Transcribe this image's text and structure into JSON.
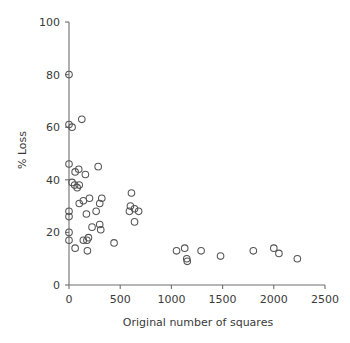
{
  "chart_data": {
    "type": "scatter",
    "title": "",
    "xlabel": "Original number of squares",
    "ylabel": "% Loss",
    "xlim": [
      0,
      2500
    ],
    "ylim": [
      0,
      100
    ],
    "xticks": [
      0,
      500,
      1000,
      1500,
      2000,
      2500
    ],
    "yticks": [
      0,
      20,
      40,
      60,
      80,
      100
    ],
    "xtick_labels": [
      "0",
      "500",
      "1000",
      "1500",
      "2000",
      "2500"
    ],
    "ytick_labels": [
      "0",
      "20",
      "40",
      "60",
      "80",
      "100"
    ],
    "grid": false,
    "legend": null,
    "marker": "open-circle",
    "marker_color": "#555555",
    "points": [
      {
        "x": 0,
        "y": 80
      },
      {
        "x": 0,
        "y": 61
      },
      {
        "x": 30,
        "y": 60
      },
      {
        "x": 125,
        "y": 63
      },
      {
        "x": 0,
        "y": 46
      },
      {
        "x": 60,
        "y": 43
      },
      {
        "x": 95,
        "y": 44
      },
      {
        "x": 160,
        "y": 42
      },
      {
        "x": 285,
        "y": 45
      },
      {
        "x": 30,
        "y": 39
      },
      {
        "x": 55,
        "y": 38
      },
      {
        "x": 80,
        "y": 37
      },
      {
        "x": 100,
        "y": 38
      },
      {
        "x": 610,
        "y": 35
      },
      {
        "x": 200,
        "y": 33
      },
      {
        "x": 100,
        "y": 31
      },
      {
        "x": 140,
        "y": 32
      },
      {
        "x": 300,
        "y": 31
      },
      {
        "x": 320,
        "y": 33
      },
      {
        "x": 0,
        "y": 28
      },
      {
        "x": 0,
        "y": 26
      },
      {
        "x": 170,
        "y": 27
      },
      {
        "x": 265,
        "y": 28
      },
      {
        "x": 590,
        "y": 28
      },
      {
        "x": 600,
        "y": 30
      },
      {
        "x": 640,
        "y": 29
      },
      {
        "x": 680,
        "y": 28
      },
      {
        "x": 225,
        "y": 22
      },
      {
        "x": 300,
        "y": 23
      },
      {
        "x": 310,
        "y": 21
      },
      {
        "x": 640,
        "y": 24
      },
      {
        "x": 0,
        "y": 20
      },
      {
        "x": 0,
        "y": 17
      },
      {
        "x": 140,
        "y": 17
      },
      {
        "x": 175,
        "y": 17
      },
      {
        "x": 190,
        "y": 18
      },
      {
        "x": 440,
        "y": 16
      },
      {
        "x": 60,
        "y": 14
      },
      {
        "x": 180,
        "y": 13
      },
      {
        "x": 1050,
        "y": 13
      },
      {
        "x": 1130,
        "y": 14
      },
      {
        "x": 1150,
        "y": 10
      },
      {
        "x": 1155,
        "y": 9
      },
      {
        "x": 1290,
        "y": 13
      },
      {
        "x": 1480,
        "y": 11
      },
      {
        "x": 1800,
        "y": 13
      },
      {
        "x": 2000,
        "y": 14
      },
      {
        "x": 2050,
        "y": 12
      },
      {
        "x": 2230,
        "y": 10
      }
    ]
  }
}
